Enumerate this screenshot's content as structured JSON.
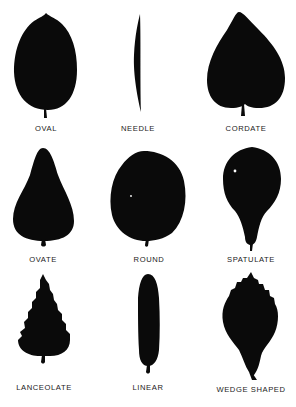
{
  "diagram": {
    "fill_color": "#0a0a0a",
    "background_color": "#ffffff",
    "leaves": [
      {
        "row": 1,
        "col": 1,
        "label": "OVAL"
      },
      {
        "row": 1,
        "col": 2,
        "label": "NEEDLE"
      },
      {
        "row": 1,
        "col": 3,
        "label": "CORDATE"
      },
      {
        "row": 2,
        "col": 1,
        "label": "OVATE"
      },
      {
        "row": 2,
        "col": 2,
        "label": "ROUND"
      },
      {
        "row": 2,
        "col": 3,
        "label": "SPATULATE"
      },
      {
        "row": 3,
        "col": 1,
        "label": "LANCEOLATE"
      },
      {
        "row": 3,
        "col": 2,
        "label": "LINEAR"
      },
      {
        "row": 3,
        "col": 3,
        "label": "WEDGE SHAPED"
      }
    ]
  }
}
